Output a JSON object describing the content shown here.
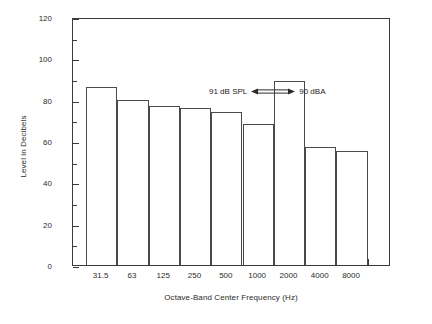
{
  "chart_data": {
    "type": "bar",
    "title": "",
    "xlabel": "Octave-Band Center Frequency (Hz)",
    "ylabel": "Level in Decibels",
    "categories": [
      "31.5",
      "63",
      "125",
      "250",
      "500",
      "1000",
      "2000",
      "4000",
      "8000"
    ],
    "values": [
      86,
      80,
      77,
      76,
      74,
      68,
      89,
      57,
      55
    ],
    "ylim": [
      0,
      120
    ],
    "y_major_ticks": [
      0,
      20,
      40,
      60,
      80,
      100,
      120
    ],
    "y_minor_ticks": [
      10,
      30,
      50,
      70,
      90,
      110
    ],
    "y_tick_labels": [
      "0",
      "20",
      "40",
      "60",
      "80",
      "100",
      "120"
    ],
    "grid": false,
    "legend": null,
    "annotations": [
      {
        "text_left": "91 dB SPL",
        "arrow": "double-headed",
        "text_right": "90 dBA"
      }
    ]
  },
  "axes": {
    "y_title": "Level in Decibels",
    "x_title": "Octave-Band Center Frequency (Hz)"
  },
  "colors": {
    "frame": "#3a3a3a",
    "bar_outline": "#4a4a4a",
    "bar_fill": "#ffffff",
    "text": "#222222",
    "background": "#ffffff"
  }
}
